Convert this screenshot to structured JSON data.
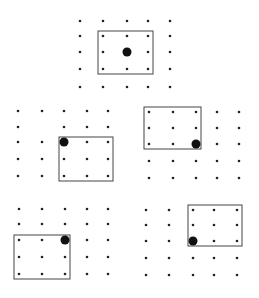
{
  "diagram": {
    "colors": {
      "dot": "#222222",
      "highlight": "#111111",
      "frame": "#444444",
      "background": "#ffffff"
    },
    "panels": [
      {
        "id": "top",
        "rows": 5,
        "cols": 5,
        "missing": [],
        "window": {
          "col_start": 1,
          "row_start": 1,
          "cols": 3,
          "rows": 3
        },
        "highlight": {
          "row": 2,
          "col": 2
        }
      },
      {
        "id": "middle-left",
        "rows": 5,
        "cols": 5,
        "missing": [
          {
            "row": 1,
            "col": 1
          }
        ],
        "window": {
          "col_start": 2,
          "row_start": 2,
          "cols": 3,
          "rows": 3
        },
        "highlight": {
          "row": 2,
          "col": 2
        }
      },
      {
        "id": "middle-right",
        "rows": 5,
        "cols": 5,
        "missing": [],
        "window": {
          "col_start": 0,
          "row_start": 0,
          "cols": 3,
          "rows": 3
        },
        "highlight": {
          "row": 2,
          "col": 2
        }
      },
      {
        "id": "bottom-left",
        "rows": 5,
        "cols": 5,
        "missing": [],
        "window": {
          "col_start": 0,
          "row_start": 2,
          "cols": 3,
          "rows": 3
        },
        "highlight": {
          "row": 2,
          "col": 2
        }
      },
      {
        "id": "bottom-right",
        "rows": 5,
        "cols": 5,
        "missing": [],
        "window": {
          "col_start": 2,
          "row_start": 0,
          "cols": 3,
          "rows": 3
        },
        "highlight": {
          "row": 2,
          "col": 2
        }
      }
    ]
  }
}
